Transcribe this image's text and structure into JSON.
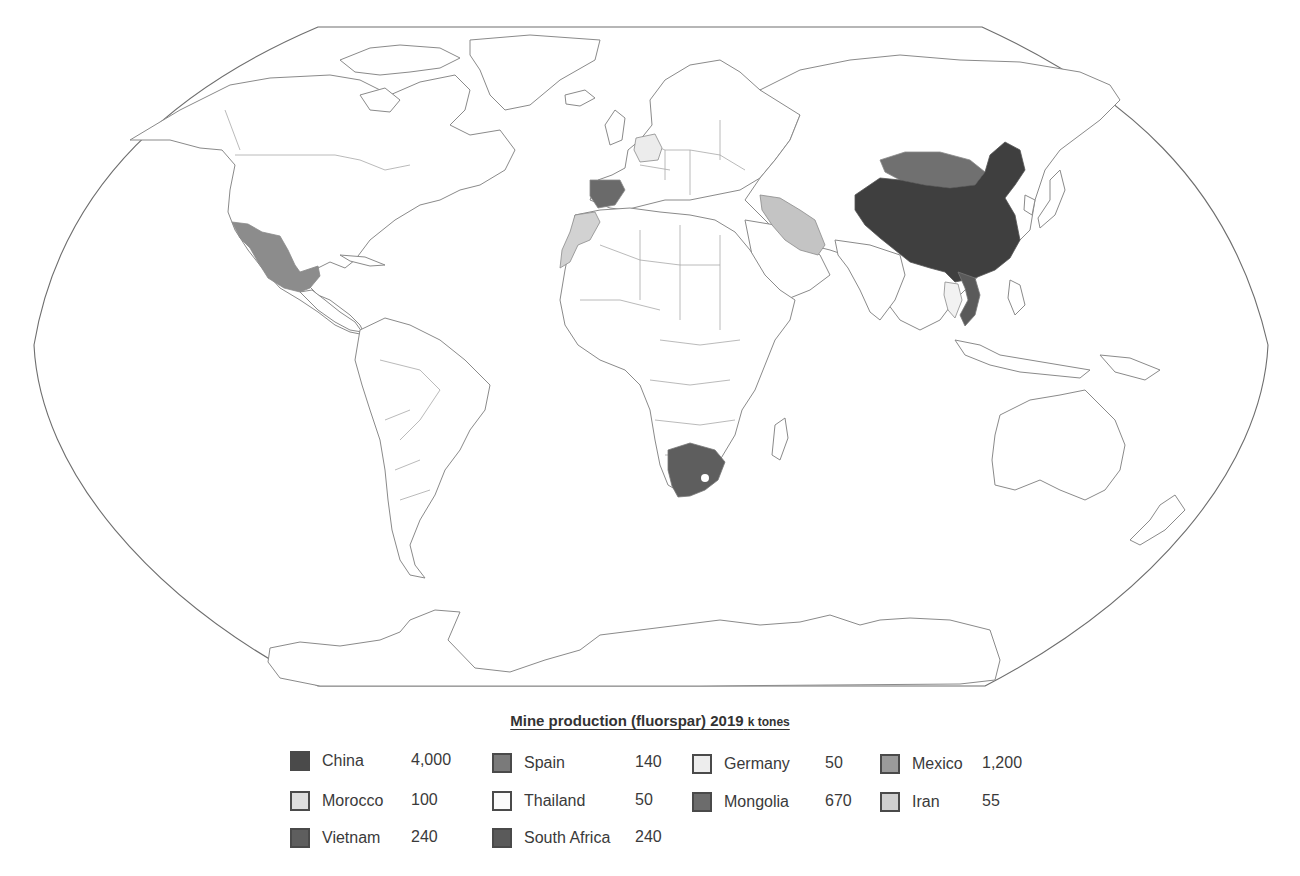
{
  "map": {
    "projection": "Robinson-style world map (Pacific-centered crop, Europe/Africa center)",
    "frame_color": "#6e6e6e",
    "border_color": "#8a8a8a",
    "highlighted_countries": [
      {
        "name": "China",
        "fill": "#3f3f3f"
      },
      {
        "name": "Mongolia",
        "fill": "#6e6e6e"
      },
      {
        "name": "Mexico",
        "fill": "#8c8c8c"
      },
      {
        "name": "Spain",
        "fill": "#6a6a6a"
      },
      {
        "name": "Vietnam",
        "fill": "#5a5a5a"
      },
      {
        "name": "South Africa",
        "fill": "#5e5e5e"
      },
      {
        "name": "Iran",
        "fill": "#c4c4c4"
      },
      {
        "name": "Morocco",
        "fill": "#d2d2d2"
      },
      {
        "name": "Germany",
        "fill": "#ececec"
      },
      {
        "name": "Thailand",
        "fill": "#f4f4f4"
      }
    ]
  },
  "legend": {
    "title": "Mine production (fluorspar) 2019",
    "unit": "k tones",
    "items": [
      {
        "country": "China",
        "value": "4,000",
        "color": "#4a4a4a"
      },
      {
        "country": "Spain",
        "value": "140",
        "color": "#7a7a7a"
      },
      {
        "country": "Germany",
        "value": "50",
        "color": "#ededed"
      },
      {
        "country": "Mexico",
        "value": "1,200",
        "color": "#9a9a9a"
      },
      {
        "country": "Morocco",
        "value": "100",
        "color": "#dedede"
      },
      {
        "country": "Thailand",
        "value": "50",
        "color": "#fafafa"
      },
      {
        "country": "Mongolia",
        "value": "670",
        "color": "#6c6c6c"
      },
      {
        "country": "Iran",
        "value": "55",
        "color": "#cfcfcf"
      },
      {
        "country": "Vietnam",
        "value": "240",
        "color": "#5e5e5e"
      },
      {
        "country": "South Africa",
        "value": "240",
        "color": "#5a5a5a"
      }
    ]
  }
}
